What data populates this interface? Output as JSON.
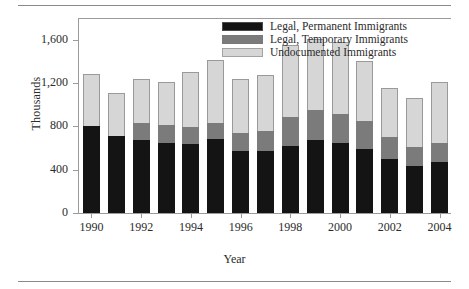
{
  "chart_data": {
    "type": "bar",
    "subtype": "stacked-vertical",
    "title": "",
    "xlabel": "Year",
    "ylabel": "Thousands",
    "ylim": [
      0,
      1800
    ],
    "yticks": [
      0,
      400,
      800,
      1200,
      1600
    ],
    "ytick_labels": [
      "0",
      "400",
      "800",
      "1,200",
      "1,600"
    ],
    "grid": false,
    "legend_position": "top-right",
    "categories": [
      1990,
      1991,
      1992,
      1993,
      1994,
      1995,
      1996,
      1997,
      1998,
      1999,
      2000,
      2001,
      2002,
      2003,
      2004
    ],
    "xtick_labels": [
      "1990",
      "1992",
      "1994",
      "1996",
      "1998",
      "2000",
      "2002",
      "2004"
    ],
    "xtick_categories": [
      1990,
      1992,
      1994,
      1996,
      1998,
      2000,
      2002,
      2004
    ],
    "series": [
      {
        "name": "Legal, Permanent Immigrants",
        "color": "#141414",
        "values": [
          800,
          710,
          675,
          650,
          635,
          680,
          570,
          575,
          620,
          670,
          645,
          590,
          500,
          430,
          470
        ]
      },
      {
        "name": "Legal, Temporary Immigrants",
        "color": "#7b7b7b",
        "values": [
          0,
          0,
          155,
          160,
          160,
          150,
          170,
          180,
          265,
          280,
          265,
          260,
          205,
          175,
          175
        ]
      },
      {
        "name": "Undocumented Immigrants",
        "color": "#d6d6d6",
        "values": [
          480,
          400,
          410,
          400,
          510,
          580,
          500,
          515,
          665,
          655,
          665,
          550,
          450,
          455,
          565
        ]
      }
    ],
    "totals": [
      1280,
      1110,
      1240,
      1210,
      1305,
      1410,
      1240,
      1270,
      1550,
      1605,
      1575,
      1400,
      1155,
      1060,
      1210
    ]
  },
  "legend": {
    "items": [
      {
        "label": "Legal, Permanent Immigrants",
        "color": "#141414"
      },
      {
        "label": "Legal, Temporary Immigrants",
        "color": "#7b7b7b"
      },
      {
        "label": "Undocumented Immigrants",
        "color": "#d6d6d6"
      }
    ]
  },
  "axes": {
    "y_title": "Thousands",
    "x_title": "Year"
  }
}
